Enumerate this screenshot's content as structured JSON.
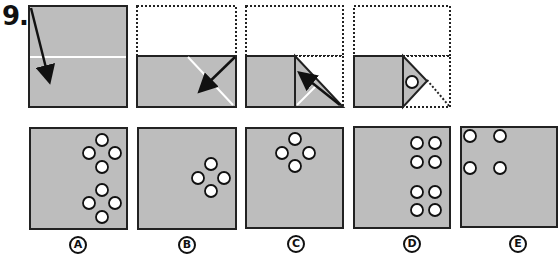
{
  "question": {
    "number": "9."
  },
  "colors": {
    "paper": "#bdbdbd",
    "outline": "#222222",
    "fold_line": "#ffffff",
    "hole": "#ffffff"
  },
  "folding_steps": [
    {
      "step": 1,
      "description": "Full square paper with horizontal fold crease and arrow folding top down"
    },
    {
      "step": 2,
      "description": "Top half folded down (dotted outline), diagonal crease, arrow folding bottom-right corner"
    },
    {
      "step": 3,
      "description": "Paper folded with vertical crease and triangle flap; arrow folding triangle"
    },
    {
      "step": 4,
      "description": "Final folded shape with single punched hole in triangle"
    }
  ],
  "options": [
    {
      "label": "A",
      "holes": 8
    },
    {
      "label": "B",
      "holes": 4
    },
    {
      "label": "C",
      "holes": 4
    },
    {
      "label": "D",
      "holes": 8
    },
    {
      "label": "E",
      "holes": 4
    }
  ]
}
